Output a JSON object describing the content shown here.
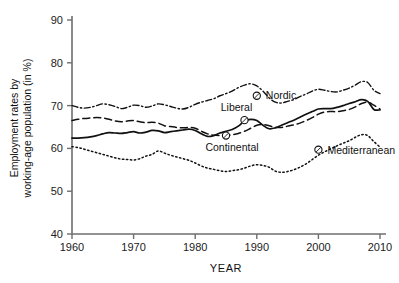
{
  "chart_data": {
    "type": "line",
    "title": "",
    "xlabel": "YEAR",
    "ylabel": "Employment rates by working-age population (in %)",
    "xlim": [
      1960,
      2010
    ],
    "ylim": [
      40,
      90
    ],
    "xticks": [
      1960,
      1970,
      1980,
      1990,
      2000,
      2010
    ],
    "yticks": [
      40,
      50,
      60,
      70,
      80,
      90
    ],
    "grid": false,
    "legend_position": "inline-callouts",
    "series": [
      {
        "name": "Nordic",
        "style": "dash-dot",
        "label_anchor_x": 1990,
        "label_anchor_y": 72.3,
        "x": [
          1960,
          1961,
          1962,
          1963,
          1964,
          1965,
          1966,
          1967,
          1968,
          1969,
          1970,
          1971,
          1972,
          1973,
          1974,
          1975,
          1976,
          1977,
          1978,
          1979,
          1980,
          1981,
          1982,
          1983,
          1984,
          1985,
          1986,
          1987,
          1988,
          1989,
          1990,
          1991,
          1992,
          1993,
          1994,
          1995,
          1996,
          1997,
          1998,
          1999,
          2000,
          2001,
          2002,
          2003,
          2004,
          2005,
          2006,
          2007,
          2008,
          2009,
          2010
        ],
        "y": [
          70.0,
          69.6,
          69.4,
          69.6,
          70.0,
          70.4,
          70.2,
          69.8,
          69.3,
          69.6,
          70.1,
          70.0,
          69.6,
          69.9,
          70.4,
          70.2,
          69.8,
          69.4,
          69.2,
          69.6,
          70.3,
          70.8,
          71.2,
          71.6,
          72.3,
          72.8,
          73.4,
          74.2,
          74.8,
          75.1,
          74.6,
          73.4,
          71.8,
          70.8,
          70.6,
          71.0,
          71.4,
          72.1,
          72.7,
          73.4,
          73.8,
          73.6,
          73.3,
          73.2,
          73.6,
          74.1,
          74.8,
          75.6,
          75.4,
          73.6,
          72.8
        ]
      },
      {
        "name": "Liberal",
        "style": "solid",
        "label_anchor_x": 1988,
        "label_anchor_y": 66.6,
        "x": [
          1960,
          1961,
          1962,
          1963,
          1964,
          1965,
          1966,
          1967,
          1968,
          1969,
          1970,
          1971,
          1972,
          1973,
          1974,
          1975,
          1976,
          1977,
          1978,
          1979,
          1980,
          1981,
          1982,
          1983,
          1984,
          1985,
          1986,
          1987,
          1988,
          1989,
          1990,
          1991,
          1992,
          1993,
          1994,
          1995,
          1996,
          1997,
          1998,
          1999,
          2000,
          2001,
          2002,
          2003,
          2004,
          2005,
          2006,
          2007,
          2008,
          2009,
          2010
        ],
        "y": [
          62.4,
          62.4,
          62.5,
          62.7,
          63.0,
          63.4,
          63.7,
          63.6,
          63.5,
          63.7,
          63.9,
          63.6,
          63.8,
          64.2,
          64.1,
          63.7,
          63.9,
          64.1,
          64.3,
          64.5,
          64.2,
          63.4,
          62.8,
          63.0,
          63.6,
          64.0,
          64.4,
          65.2,
          66.4,
          66.8,
          66.5,
          65.4,
          64.6,
          64.8,
          65.4,
          66.0,
          66.6,
          67.3,
          68.0,
          68.6,
          69.2,
          69.3,
          69.3,
          69.6,
          70.0,
          70.5,
          70.9,
          71.4,
          71.0,
          69.1,
          69.0
        ]
      },
      {
        "name": "Continental",
        "style": "dashed",
        "label_anchor_x": 1985,
        "label_anchor_y": 63.0,
        "x": [
          1960,
          1961,
          1962,
          1963,
          1964,
          1965,
          1966,
          1967,
          1968,
          1969,
          1970,
          1971,
          1972,
          1973,
          1974,
          1975,
          1976,
          1977,
          1978,
          1979,
          1980,
          1981,
          1982,
          1983,
          1984,
          1985,
          1986,
          1987,
          1988,
          1989,
          1990,
          1991,
          1992,
          1993,
          1994,
          1995,
          1996,
          1997,
          1998,
          1999,
          2000,
          2001,
          2002,
          2003,
          2004,
          2005,
          2006,
          2007,
          2008,
          2009,
          2010
        ],
        "y": [
          66.5,
          66.8,
          67.0,
          67.1,
          67.2,
          67.1,
          66.8,
          66.4,
          66.2,
          66.4,
          66.5,
          66.2,
          66.0,
          66.1,
          65.9,
          65.3,
          65.1,
          64.9,
          64.8,
          64.9,
          64.7,
          64.0,
          63.4,
          63.1,
          63.0,
          63.0,
          63.2,
          63.5,
          64.0,
          64.7,
          65.4,
          65.6,
          65.3,
          64.9,
          64.9,
          65.2,
          65.5,
          65.9,
          66.5,
          67.2,
          68.0,
          68.5,
          68.6,
          68.6,
          68.8,
          69.1,
          69.7,
          70.5,
          70.8,
          70.1,
          69.2
        ]
      },
      {
        "name": "Mediterranean",
        "style": "dotted",
        "label_anchor_x": 2000,
        "label_anchor_y": 59.7,
        "x": [
          1960,
          1961,
          1962,
          1963,
          1964,
          1965,
          1966,
          1967,
          1968,
          1969,
          1970,
          1971,
          1972,
          1973,
          1974,
          1975,
          1976,
          1977,
          1978,
          1979,
          1980,
          1981,
          1982,
          1983,
          1984,
          1985,
          1986,
          1987,
          1988,
          1989,
          1990,
          1991,
          1992,
          1993,
          1994,
          1995,
          1996,
          1997,
          1998,
          1999,
          2000,
          2001,
          2002,
          2003,
          2004,
          2005,
          2006,
          2007,
          2008,
          2009,
          2010
        ],
        "y": [
          60.4,
          60.2,
          59.8,
          59.4,
          59.0,
          58.6,
          58.2,
          57.8,
          57.5,
          57.4,
          57.3,
          57.6,
          58.2,
          58.6,
          59.4,
          58.9,
          58.4,
          58.0,
          57.6,
          57.2,
          56.6,
          55.9,
          55.4,
          55.1,
          54.8,
          54.6,
          54.8,
          55.0,
          55.4,
          55.9,
          56.2,
          56.0,
          55.6,
          54.7,
          54.4,
          54.6,
          55.0,
          55.6,
          56.4,
          57.4,
          58.4,
          59.2,
          59.9,
          60.6,
          61.2,
          61.8,
          62.6,
          63.2,
          63.0,
          61.6,
          60.3
        ]
      }
    ]
  },
  "axes": {
    "x_tick_labels": [
      "1960",
      "1970",
      "1980",
      "1990",
      "2000",
      "2010"
    ],
    "y_tick_labels": [
      "40",
      "50",
      "60",
      "70",
      "80",
      "90"
    ],
    "x_title": "YEAR",
    "y_title_line1": "Employment rates by",
    "y_title_line2": "working-age population (in %)"
  },
  "colors": {
    "axis": "#6e6e6e",
    "ink": "#111111",
    "background": "#ffffff"
  }
}
